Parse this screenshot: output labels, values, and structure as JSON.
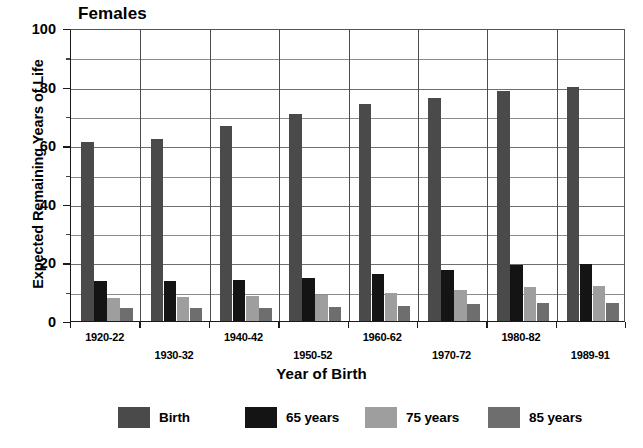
{
  "chart_data": {
    "type": "bar",
    "title": "Females",
    "xlabel": "Year of Birth",
    "ylabel": "Expected Remaining Years of Life",
    "ylim": [
      0,
      100
    ],
    "yticks": [
      0,
      20,
      40,
      60,
      80,
      100
    ],
    "yminor_step": 10,
    "grid": true,
    "legend_position": "bottom",
    "categories": [
      "1920-22",
      "1930-32",
      "1940-42",
      "1950-52",
      "1960-62",
      "1970-72",
      "1980-82",
      "1989-91"
    ],
    "series": [
      {
        "name": "Birth",
        "color": "#4a4a4a",
        "values": [
          61.0,
          62.2,
          66.5,
          70.5,
          74.0,
          76.0,
          78.5,
          80.0
        ]
      },
      {
        "name": "65 years",
        "color": "#141414",
        "values": [
          13.5,
          13.8,
          14.0,
          14.8,
          16.0,
          17.5,
          19.0,
          19.3
        ]
      },
      {
        "name": "75 years",
        "color": "#9e9e9e",
        "values": [
          8.0,
          8.3,
          8.4,
          8.8,
          9.5,
          10.5,
          11.6,
          11.8
        ]
      },
      {
        "name": "85 years",
        "color": "#6e6e6e",
        "values": [
          4.5,
          4.6,
          4.6,
          4.8,
          5.0,
          5.9,
          6.3,
          6.3
        ]
      }
    ]
  },
  "colors": {
    "axis": "#1a1a1a",
    "grid": "#8a8a8a",
    "background": "#ffffff"
  }
}
